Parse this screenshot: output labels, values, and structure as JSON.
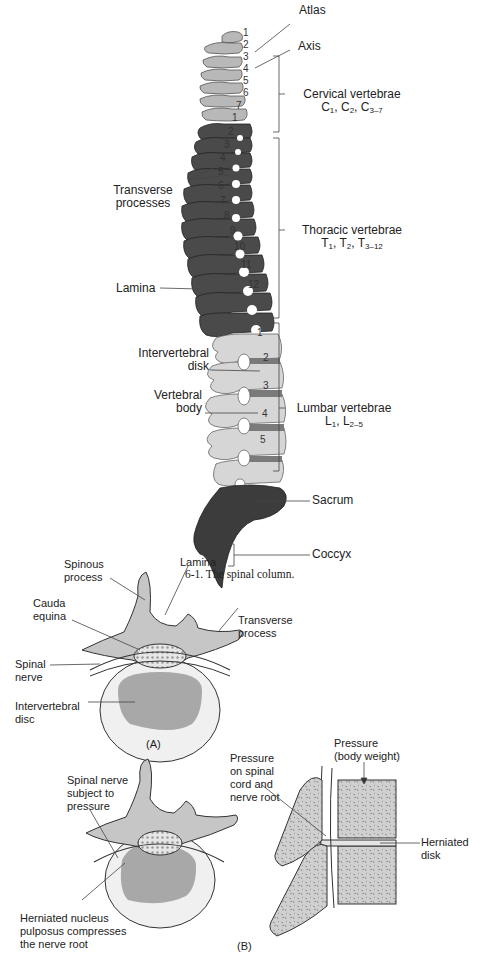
{
  "figure_top": {
    "caption": "6-1. The spinal column.",
    "labels": {
      "atlas": "Atlas",
      "axis": "Axis",
      "transverse_processes": [
        "Transverse",
        "processes"
      ],
      "lamina": "Lamina",
      "intervertebral_disk": [
        "Intervertebral",
        "disk"
      ],
      "vertebral_body": [
        "Vertebral",
        "body"
      ],
      "sacrum": "Sacrum",
      "coccyx": "Coccyx"
    },
    "regions": [
      {
        "name": "Cervical vertebrae",
        "notation": [
          "C",
          "1",
          ", C",
          "2",
          ", C",
          "3–7"
        ]
      },
      {
        "name": "Thoracic vertebrae",
        "notation": [
          "T",
          "1",
          ", T",
          "2",
          ", T",
          "3–12"
        ]
      },
      {
        "name": "Lumbar vertebrae",
        "notation": [
          "L",
          "1",
          ", L",
          "2–5"
        ]
      }
    ],
    "cervical_numbers": [
      "1",
      "2",
      "3",
      "4",
      "5",
      "6",
      "7"
    ],
    "thoracic_numbers": [
      "1",
      "2",
      "3",
      "4",
      "5",
      "6",
      "7",
      "8",
      "9",
      "10",
      "11",
      "12"
    ],
    "lumbar_numbers": [
      "1",
      "2",
      "3",
      "4",
      "5"
    ]
  },
  "figure_a": {
    "panel_label": "(A)",
    "labels": {
      "spinous_process": [
        "Spinous",
        "process"
      ],
      "lamina": "Lamina",
      "cauda_equina": [
        "Cauda",
        "equina"
      ],
      "transverse_process": [
        "Transverse",
        "process"
      ],
      "spinal_nerve": [
        "Spinal",
        "nerve"
      ],
      "intervertebral_disc": [
        "Intervertebral",
        "disc"
      ]
    }
  },
  "figure_b": {
    "panel_label": "(B)",
    "labels": {
      "spinal_nerve_pressure": [
        "Spinal nerve",
        "subject to",
        "pressure"
      ],
      "herniated_nucleus": [
        "Herniated nucleus",
        "pulposus compresses",
        "the nerve root"
      ],
      "pressure_cord": [
        "Pressure",
        "on spinal",
        "cord and",
        "nerve root"
      ],
      "pressure_body": [
        "Pressure",
        "(body weight)"
      ],
      "herniated_disk": [
        "Herniated",
        "disk"
      ]
    }
  },
  "colors": {
    "cervical": "#b5b5b5",
    "thoracic": "#4a4a4a",
    "lumbar": "#d4d4d4",
    "sacrum": "#3a3a3a",
    "disc": "#7a7a7a",
    "bone_light": "#c8c8c8",
    "line": "#333333"
  }
}
